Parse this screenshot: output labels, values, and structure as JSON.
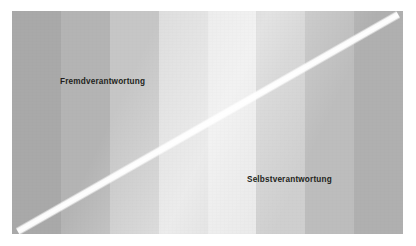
{
  "figure": {
    "name": "verantwortungs-kontinuum",
    "background_color": "#ffffff",
    "plate": {
      "x": 12,
      "y": 11,
      "width": 391,
      "height": 223
    },
    "divider": {
      "name": "white-diagonal-divider",
      "color": "#ffffff",
      "from": "bottom-left",
      "to": "top-right",
      "angle_deg": -29.7,
      "thickness_px": 9
    },
    "bands": [
      {
        "index": 1,
        "color": "#a9a9a9"
      },
      {
        "index": 2,
        "color": "#b4b4b4"
      },
      {
        "index": 3,
        "color": "#c6c6c6"
      },
      {
        "index": 4,
        "color": "#dedede"
      },
      {
        "index": 5,
        "color": "#e9e9e9"
      },
      {
        "index": 6,
        "color": "#cfcfcf"
      },
      {
        "index": 7,
        "color": "#bdbdbd"
      },
      {
        "index": 8,
        "color": "#b0b0b0"
      }
    ],
    "labels": {
      "upper_left": "Fremdverantwortung",
      "lower_right": "Selbstverantwortung",
      "text_color": "#231f20"
    }
  }
}
